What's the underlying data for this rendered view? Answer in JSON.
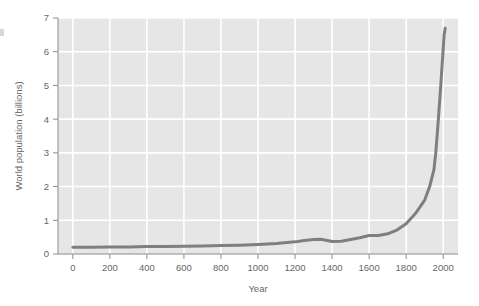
{
  "chart_data": {
    "type": "line",
    "title": "",
    "xlabel": "Year",
    "ylabel": "World population (billions)",
    "xlim": [
      -80,
      2080
    ],
    "ylim": [
      0,
      7
    ],
    "xticks": [
      0,
      200,
      400,
      600,
      800,
      1000,
      1200,
      1400,
      1600,
      1800,
      2000
    ],
    "xtick_labels": [
      "0",
      "200",
      "400",
      "600",
      "800",
      "1000",
      "1200",
      "1400",
      "1600",
      "1800",
      "2000"
    ],
    "yticks": [
      0,
      1,
      2,
      3,
      4,
      5,
      6,
      7
    ],
    "ytick_labels": [
      "0",
      "1",
      "2",
      "3",
      "4",
      "5",
      "6",
      "7"
    ],
    "grid": true,
    "grid_color": "#ffffff",
    "plot_background": "#e6e6e6",
    "figure_background": "#ffffff",
    "legend": null,
    "series": [
      {
        "name": "World population",
        "color": "#7f7f7f",
        "line_width": 3,
        "x": [
          0,
          100,
          200,
          300,
          400,
          500,
          600,
          700,
          800,
          900,
          1000,
          1100,
          1200,
          1250,
          1300,
          1340,
          1400,
          1450,
          1500,
          1550,
          1600,
          1650,
          1700,
          1750,
          1800,
          1850,
          1900,
          1927,
          1950,
          1960,
          1974,
          1987,
          1999,
          2005,
          2011
        ],
        "y": [
          0.2,
          0.2,
          0.21,
          0.21,
          0.22,
          0.22,
          0.23,
          0.24,
          0.25,
          0.26,
          0.28,
          0.31,
          0.36,
          0.4,
          0.43,
          0.44,
          0.37,
          0.38,
          0.43,
          0.48,
          0.55,
          0.55,
          0.6,
          0.71,
          0.9,
          1.2,
          1.6,
          2.0,
          2.5,
          3.0,
          4.0,
          5.0,
          6.0,
          6.5,
          6.7
        ]
      }
    ]
  },
  "axis": {
    "y_axis_label": "World population (billions)",
    "x_axis_label": "Year"
  }
}
